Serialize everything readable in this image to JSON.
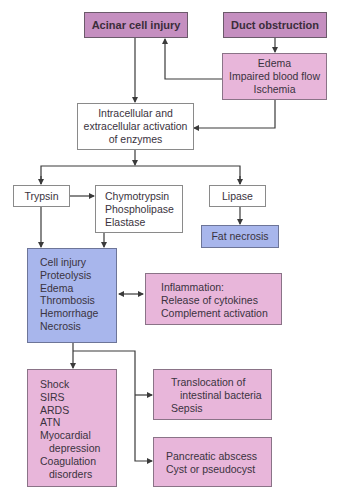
{
  "diagram": {
    "nodes": {
      "acinar": {
        "label": "Acinar cell injury"
      },
      "duct": {
        "label": "Duct obstruction"
      },
      "edema": {
        "lines": [
          "Edema",
          "Impaired blood flow",
          "Ischemia"
        ]
      },
      "activation": {
        "lines": [
          "Intracellular and",
          "extracellular activation",
          "of enzymes"
        ]
      },
      "trypsin": {
        "label": "Trypsin"
      },
      "enzymes": {
        "lines": [
          "Chymotrypsin",
          "Phospholipase",
          "Elastase"
        ]
      },
      "lipase": {
        "label": "Lipase"
      },
      "fat_necrosis": {
        "label": "Fat necrosis"
      },
      "cell_injury": {
        "lines": [
          "Cell injury",
          "Proteolysis",
          "Edema",
          "Thrombosis",
          "Hemorrhage",
          "Necrosis"
        ]
      },
      "inflammation": {
        "lines": [
          "Inflammation:",
          "Release of cytokines",
          "Complement activation"
        ]
      },
      "systemic": {
        "lines": [
          "Shock",
          "SIRS",
          "ARDS",
          "ATN",
          "Myocardial",
          "depression",
          "Coagulation",
          "disorders"
        ]
      },
      "translocation": {
        "lines": [
          "Translocation of",
          "intestinal bacteria",
          "Sepsis"
        ]
      },
      "abscess": {
        "lines": [
          "Pancreatic abscess",
          "Cyst or pseudocyst"
        ]
      }
    },
    "edges": [
      {
        "from": "acinar",
        "to": "activation"
      },
      {
        "from": "duct",
        "to": "edema"
      },
      {
        "from": "edema",
        "to": "acinar"
      },
      {
        "from": "edema",
        "to": "activation"
      },
      {
        "from": "activation",
        "to": "trypsin"
      },
      {
        "from": "activation",
        "to": "lipase"
      },
      {
        "from": "trypsin",
        "to": "enzymes"
      },
      {
        "from": "trypsin",
        "to": "cell_injury"
      },
      {
        "from": "enzymes",
        "to": "cell_injury"
      },
      {
        "from": "lipase",
        "to": "fat_necrosis"
      },
      {
        "from": "cell_injury",
        "to": "inflammation",
        "bidirectional": true
      },
      {
        "from": "cell_injury",
        "to": "systemic"
      },
      {
        "from": "cell_injury",
        "to": "translocation"
      },
      {
        "from": "cell_injury",
        "to": "abscess"
      }
    ],
    "colors": {
      "initiating": "#c58fc0",
      "pink": "#e8b6da",
      "blue": "#a8b6ec",
      "white": "#ffffff",
      "line": "#3a3a3a"
    }
  }
}
